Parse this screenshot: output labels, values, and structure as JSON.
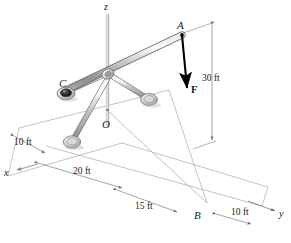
{
  "figure": {
    "type": "engineering-statics-free-body-diagram",
    "background_color": "#ffffff",
    "line_color": "#808080",
    "member_color": "#b5b5b5",
    "text_color": "#1a1a1a",
    "force_color": "#000000"
  },
  "axes": {
    "z_label": "z",
    "x_label": "x",
    "y_label": "y"
  },
  "points": {
    "A": "A",
    "B": "B",
    "C": "C",
    "O": "O"
  },
  "force": {
    "label": "F"
  },
  "dimensions": [
    {
      "id": "height-30",
      "label": "30 ft"
    },
    {
      "id": "offset-10-left",
      "label": "10 ft"
    },
    {
      "id": "span-20",
      "label": "20 ft"
    },
    {
      "id": "span-15",
      "label": "15 ft"
    },
    {
      "id": "offset-10-right",
      "label": "10 ft"
    }
  ],
  "joints": [
    {
      "id": "joint-c",
      "kind": "ball-and-socket",
      "style": "dark"
    },
    {
      "id": "joint-right",
      "kind": "ball-and-socket",
      "style": "light"
    },
    {
      "id": "joint-lower-left",
      "kind": "ball-and-socket",
      "style": "light"
    }
  ]
}
